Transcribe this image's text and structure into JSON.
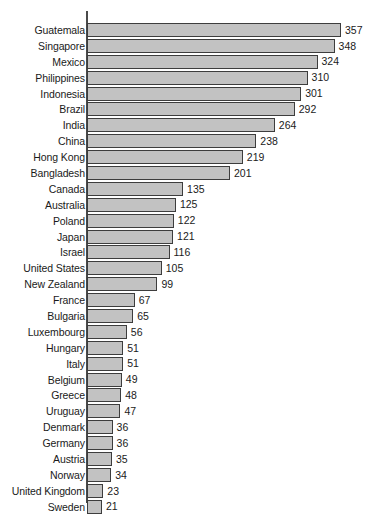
{
  "chart_data": {
    "type": "bar",
    "orientation": "horizontal",
    "title": "",
    "subtitle": "",
    "xlabel": "",
    "ylabel": "",
    "grid": false,
    "legend": null,
    "axis": {
      "value_axis_min": 0,
      "value_axis_max": 357,
      "value_axis_ticks_shown": false,
      "category_axis_line": true,
      "data_labels": true
    },
    "categories": [
      "Guatemala",
      "Singapore",
      "Mexico",
      "Philippines",
      "Indonesia",
      "Brazil",
      "India",
      "China",
      "Hong Kong",
      "Bangladesh",
      "Canada",
      "Australia",
      "Poland",
      "Japan",
      "Israel",
      "United States",
      "New Zealand",
      "France",
      "Bulgaria",
      "Luxembourg",
      "Hungary",
      "Italy",
      "Belgium",
      "Greece",
      "Uruguay",
      "Denmark",
      "Germany",
      "Austria",
      "Norway",
      "United Kingdom",
      "Sweden"
    ],
    "values": [
      357,
      348,
      324,
      310,
      301,
      292,
      264,
      238,
      219,
      201,
      135,
      125,
      122,
      121,
      116,
      105,
      99,
      67,
      65,
      56,
      51,
      51,
      49,
      48,
      47,
      36,
      36,
      35,
      34,
      23,
      21
    ],
    "colors": {
      "bar_fill": "#c2c2c2",
      "bar_border": "#3d3d3d",
      "axis": "#4a4a4a",
      "text": "#1a1a1a",
      "background": "#ffffff"
    }
  }
}
